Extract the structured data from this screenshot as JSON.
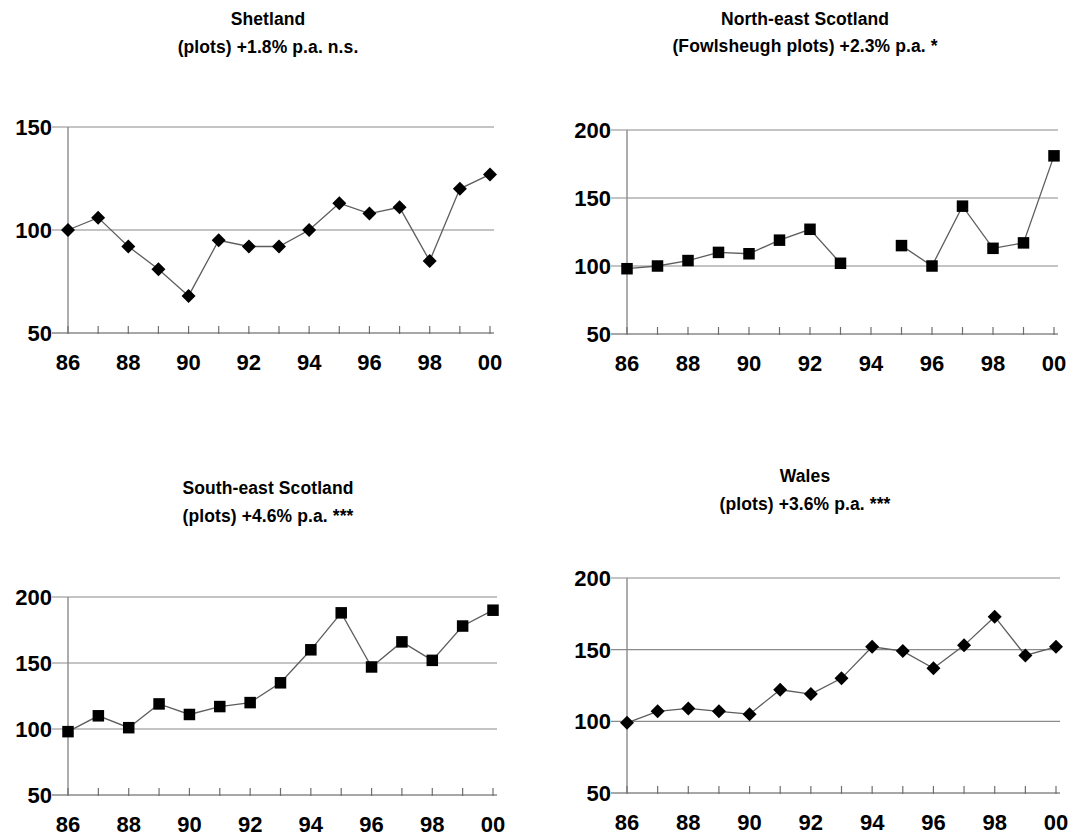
{
  "figure": {
    "background": "#ffffff",
    "marker_color": "#000000",
    "line_color": "#5d5d5d",
    "grid_color": "#8a8a8a"
  },
  "panels": [
    {
      "id": "shetland",
      "title_line1": "Shetland",
      "title_line2": "(plots) +1.8% p.a. n.s.",
      "marker_shape": "diamond",
      "chart_data": {
        "type": "line",
        "title": "Shetland",
        "subtitle": "(plots) +1.8% p.a. n.s.",
        "xlabel": "",
        "ylabel": "",
        "x": [
          1986,
          1987,
          1988,
          1989,
          1990,
          1991,
          1992,
          1993,
          1994,
          1995,
          1996,
          1997,
          1998,
          1999,
          2000
        ],
        "xtick_labels": [
          "86",
          "",
          "88",
          "",
          "90",
          "",
          "92",
          "",
          "94",
          "",
          "96",
          "",
          "98",
          "",
          "00"
        ],
        "values": [
          100,
          106,
          92,
          81,
          68,
          95,
          92,
          92,
          100,
          113,
          108,
          111,
          85,
          120,
          127
        ],
        "ylim": [
          50,
          150
        ],
        "yticks": [
          50,
          100,
          150
        ],
        "ytick_labels": [
          "50",
          "100",
          "150"
        ],
        "xlim": [
          1986,
          2000
        ],
        "grid": true,
        "legend": "none",
        "annotation": "+1.8% p.a. n.s."
      }
    },
    {
      "id": "north-east-scotland",
      "title_line1": "North-east Scotland",
      "title_line2": "(Fowlsheugh plots)  +2.3%  p.a.  *",
      "marker_shape": "square",
      "chart_data": {
        "type": "line",
        "title": "North-east Scotland",
        "subtitle": "(Fowlsheugh plots)  +2.3%  p.a.  *",
        "xlabel": "",
        "ylabel": "",
        "x": [
          1986,
          1987,
          1988,
          1989,
          1990,
          1991,
          1992,
          1993,
          1994,
          1995,
          1996,
          1997,
          1998,
          1999,
          2000
        ],
        "xtick_labels": [
          "86",
          "",
          "88",
          "",
          "90",
          "",
          "92",
          "",
          "94",
          "",
          "96",
          "",
          "98",
          "",
          "00"
        ],
        "values": [
          98,
          100,
          104,
          110,
          109,
          119,
          127,
          102,
          null,
          115,
          100,
          144,
          113,
          117,
          181
        ],
        "ylim": [
          50,
          200
        ],
        "yticks": [
          50,
          100,
          150,
          200
        ],
        "ytick_labels": [
          "50",
          "100",
          "150",
          "200"
        ],
        "xlim": [
          1986,
          2000
        ],
        "grid": true,
        "legend": "none",
        "annotation": "+2.3% p.a. *",
        "notes": "No data point for 1994 (gap in series)"
      }
    },
    {
      "id": "south-east-scotland",
      "title_line1": "South-east Scotland",
      "title_line2": "(plots) +4.6% p.a.  ***",
      "marker_shape": "square",
      "chart_data": {
        "type": "line",
        "title": "South-east Scotland",
        "subtitle": "(plots) +4.6% p.a.  ***",
        "xlabel": "",
        "ylabel": "",
        "x": [
          1986,
          1987,
          1988,
          1989,
          1990,
          1991,
          1992,
          1993,
          1994,
          1995,
          1996,
          1997,
          1998,
          1999,
          2000
        ],
        "xtick_labels": [
          "86",
          "",
          "88",
          "",
          "90",
          "",
          "92",
          "",
          "94",
          "",
          "96",
          "",
          "98",
          "",
          "00"
        ],
        "values": [
          98,
          110,
          101,
          119,
          111,
          117,
          120,
          135,
          160,
          188,
          147,
          166,
          152,
          178,
          190
        ],
        "ylim": [
          50,
          200
        ],
        "yticks": [
          50,
          100,
          150,
          200
        ],
        "ytick_labels": [
          "50",
          "100",
          "150",
          "200"
        ],
        "xlim": [
          1986,
          2000
        ],
        "grid": true,
        "legend": "none",
        "annotation": "+4.6% p.a. ***"
      }
    },
    {
      "id": "wales",
      "title_line1": "Wales",
      "title_line2": "(plots) +3.6% p.a.  ***",
      "marker_shape": "diamond",
      "chart_data": {
        "type": "line",
        "title": "Wales",
        "subtitle": "(plots) +3.6% p.a.  ***",
        "xlabel": "",
        "ylabel": "",
        "x": [
          1986,
          1987,
          1988,
          1989,
          1990,
          1991,
          1992,
          1993,
          1994,
          1995,
          1996,
          1997,
          1998,
          1999,
          2000
        ],
        "xtick_labels": [
          "86",
          "",
          "88",
          "",
          "90",
          "",
          "92",
          "",
          "94",
          "",
          "96",
          "",
          "98",
          "",
          "00"
        ],
        "values": [
          99,
          107,
          109,
          107,
          105,
          122,
          119,
          130,
          152,
          149,
          137,
          153,
          173,
          146,
          152
        ],
        "ylim": [
          50,
          200
        ],
        "yticks": [
          50,
          100,
          150,
          200
        ],
        "ytick_labels": [
          "50",
          "100",
          "150",
          "200"
        ],
        "xlim": [
          1986,
          2000
        ],
        "grid": true,
        "legend": "none",
        "annotation": "+3.6% p.a. ***"
      }
    }
  ]
}
